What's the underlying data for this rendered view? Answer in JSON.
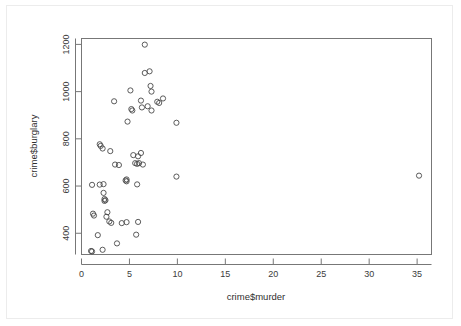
{
  "chart_data": {
    "type": "scatter",
    "title": "",
    "subtitle": "",
    "xlabel": "crime$murder",
    "ylabel": "crime$burglary",
    "xlim": [
      0,
      36.5
    ],
    "ylim": [
      310,
      1225
    ],
    "grid": false,
    "legend": null,
    "xticks": [
      0,
      5,
      10,
      15,
      20,
      25,
      30,
      35
    ],
    "xtick_labels": [
      "0",
      "5",
      "10",
      "15",
      "20",
      "25",
      "30",
      "35"
    ],
    "yticks": [
      400,
      600,
      800,
      1000,
      1200
    ],
    "ytick_labels": [
      "400",
      "600",
      "800",
      "1000",
      "1200"
    ],
    "marker": "open-circle",
    "marker_color": "#4a4a4a",
    "points": [
      {
        "x": 6.6,
        "y": 1199
      },
      {
        "x": 6.6,
        "y": 1079
      },
      {
        "x": 7.1,
        "y": 1086
      },
      {
        "x": 7.2,
        "y": 1024
      },
      {
        "x": 7.3,
        "y": 1000
      },
      {
        "x": 5.1,
        "y": 1005
      },
      {
        "x": 3.4,
        "y": 959
      },
      {
        "x": 6.2,
        "y": 962
      },
      {
        "x": 8.5,
        "y": 971
      },
      {
        "x": 7.9,
        "y": 957
      },
      {
        "x": 8.1,
        "y": 952
      },
      {
        "x": 5.2,
        "y": 926
      },
      {
        "x": 5.3,
        "y": 920
      },
      {
        "x": 6.3,
        "y": 933
      },
      {
        "x": 6.9,
        "y": 938
      },
      {
        "x": 7.3,
        "y": 920
      },
      {
        "x": 4.8,
        "y": 873
      },
      {
        "x": 9.9,
        "y": 868
      },
      {
        "x": 1.9,
        "y": 777
      },
      {
        "x": 2.0,
        "y": 770
      },
      {
        "x": 2.2,
        "y": 759
      },
      {
        "x": 3.0,
        "y": 748
      },
      {
        "x": 5.4,
        "y": 731
      },
      {
        "x": 6.2,
        "y": 740
      },
      {
        "x": 5.9,
        "y": 726
      },
      {
        "x": 3.5,
        "y": 691
      },
      {
        "x": 3.9,
        "y": 689
      },
      {
        "x": 5.6,
        "y": 697
      },
      {
        "x": 5.8,
        "y": 694
      },
      {
        "x": 6.0,
        "y": 697
      },
      {
        "x": 6.4,
        "y": 691
      },
      {
        "x": 9.9,
        "y": 640
      },
      {
        "x": 35.2,
        "y": 644
      },
      {
        "x": 4.6,
        "y": 624
      },
      {
        "x": 4.7,
        "y": 620
      },
      {
        "x": 4.7,
        "y": 628
      },
      {
        "x": 5.8,
        "y": 607
      },
      {
        "x": 1.1,
        "y": 605
      },
      {
        "x": 1.9,
        "y": 606
      },
      {
        "x": 2.3,
        "y": 608
      },
      {
        "x": 2.3,
        "y": 571
      },
      {
        "x": 2.4,
        "y": 545
      },
      {
        "x": 2.4,
        "y": 537
      },
      {
        "x": 2.5,
        "y": 540
      },
      {
        "x": 1.2,
        "y": 483
      },
      {
        "x": 1.3,
        "y": 475
      },
      {
        "x": 2.7,
        "y": 489
      },
      {
        "x": 2.6,
        "y": 470
      },
      {
        "x": 2.9,
        "y": 450
      },
      {
        "x": 3.1,
        "y": 444
      },
      {
        "x": 4.2,
        "y": 443
      },
      {
        "x": 4.7,
        "y": 447
      },
      {
        "x": 5.9,
        "y": 448
      },
      {
        "x": 1.7,
        "y": 392
      },
      {
        "x": 5.7,
        "y": 394
      },
      {
        "x": 3.7,
        "y": 357
      },
      {
        "x": 1.0,
        "y": 325
      },
      {
        "x": 1.1,
        "y": 323
      },
      {
        "x": 2.2,
        "y": 330
      }
    ]
  }
}
